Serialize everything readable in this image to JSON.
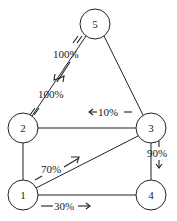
{
  "diagram": {
    "type": "network-flow",
    "nodes": [
      {
        "id": "1",
        "label": "1"
      },
      {
        "id": "2",
        "label": "2"
      },
      {
        "id": "3",
        "label": "3"
      },
      {
        "id": "4",
        "label": "4"
      },
      {
        "id": "5",
        "label": "5"
      }
    ],
    "edges": [
      {
        "from": "5",
        "to": "2"
      },
      {
        "from": "5",
        "to": "3"
      },
      {
        "from": "2",
        "to": "3"
      },
      {
        "from": "2",
        "to": "1"
      },
      {
        "from": "1",
        "to": "3"
      },
      {
        "from": "1",
        "to": "4"
      },
      {
        "from": "3",
        "to": "4"
      }
    ],
    "flows": [
      {
        "from": "2",
        "to": "5",
        "label": "100%"
      },
      {
        "from": "5",
        "to": "2",
        "label": "100%"
      },
      {
        "from": "3",
        "to": "2",
        "label": "10%"
      },
      {
        "from": "1",
        "to": "3",
        "label": "70%"
      },
      {
        "from": "1",
        "to": "4",
        "label": "30%"
      },
      {
        "from": "3",
        "to": "4",
        "label": "90%"
      }
    ]
  }
}
